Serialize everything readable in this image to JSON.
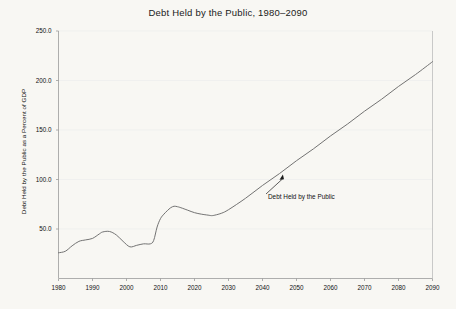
{
  "chart_data": {
    "type": "line",
    "title": "Debt Held by the Public, 1980–2090",
    "xlabel": "",
    "ylabel": "Debt Held by the Public as a Percent of GDP",
    "xlim": [
      1980,
      2090
    ],
    "ylim": [
      0.0,
      250.0
    ],
    "grid": true,
    "legend_position": "inline-annotation",
    "xticks": [
      1980,
      1990,
      2000,
      2010,
      2020,
      2030,
      2040,
      2050,
      2060,
      2070,
      2080,
      2090
    ],
    "xtick_labels": [
      "1980",
      "1990",
      "2000",
      "2010",
      "2020",
      "2030",
      "2040",
      "2050",
      "2060",
      "2070",
      "2080",
      "2090"
    ],
    "yticks": [
      50.0,
      100.0,
      150.0,
      200.0,
      250.0
    ],
    "ytick_labels": [
      "50.0",
      "100.0",
      "150.0",
      "200.0",
      "250.0"
    ],
    "annotations": [
      {
        "text": "Debt Held by the Public",
        "points_to_year": 2046,
        "points_to_value": 105
      }
    ],
    "series": [
      {
        "name": "Debt Held by the Public",
        "color": "#6b6b6b",
        "x": [
          1980,
          1982,
          1984,
          1986,
          1988,
          1990,
          1992,
          1993,
          1995,
          1997,
          1999,
          2001,
          2003,
          2005,
          2007,
          2008,
          2009,
          2010,
          2011,
          2012,
          2013,
          2014,
          2015,
          2016,
          2018,
          2020,
          2022,
          2024,
          2025,
          2026,
          2028,
          2030,
          2035,
          2040,
          2045,
          2050,
          2055,
          2060,
          2065,
          2070,
          2075,
          2080,
          2085,
          2090
        ],
        "values": [
          26.0,
          27.5,
          33.0,
          37.5,
          39.0,
          40.5,
          45.0,
          47.0,
          47.5,
          44.0,
          37.5,
          32.0,
          33.5,
          35.0,
          35.0,
          38.5,
          52.0,
          60.5,
          65.0,
          68.5,
          71.5,
          73.0,
          72.5,
          71.5,
          69.0,
          66.5,
          65.0,
          64.0,
          63.5,
          64.0,
          66.0,
          69.5,
          81.0,
          94.0,
          106.0,
          119.0,
          131.0,
          144.0,
          156.0,
          169.0,
          181.0,
          194.0,
          206.0,
          219.0
        ]
      }
    ]
  }
}
